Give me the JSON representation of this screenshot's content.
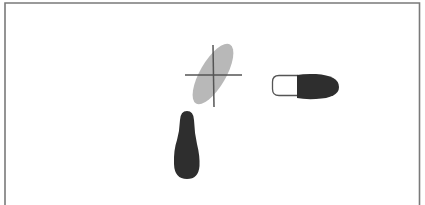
{
  "diagram": {
    "type": "footprint-step-diagram",
    "elements": [
      {
        "name": "previous-position-foot",
        "style": "ghost",
        "color": "#b8b8b8",
        "marker": "crosshair"
      },
      {
        "name": "ball-step-foot",
        "style": "toe-weighted",
        "color": "#2e2e2e",
        "heel_outline": "#555555"
      },
      {
        "name": "full-weight-foot",
        "style": "solid",
        "color": "#2e2e2e"
      }
    ],
    "colors": {
      "background": "#ffffff",
      "frame": "#777777",
      "crosshair": "#555555"
    }
  }
}
